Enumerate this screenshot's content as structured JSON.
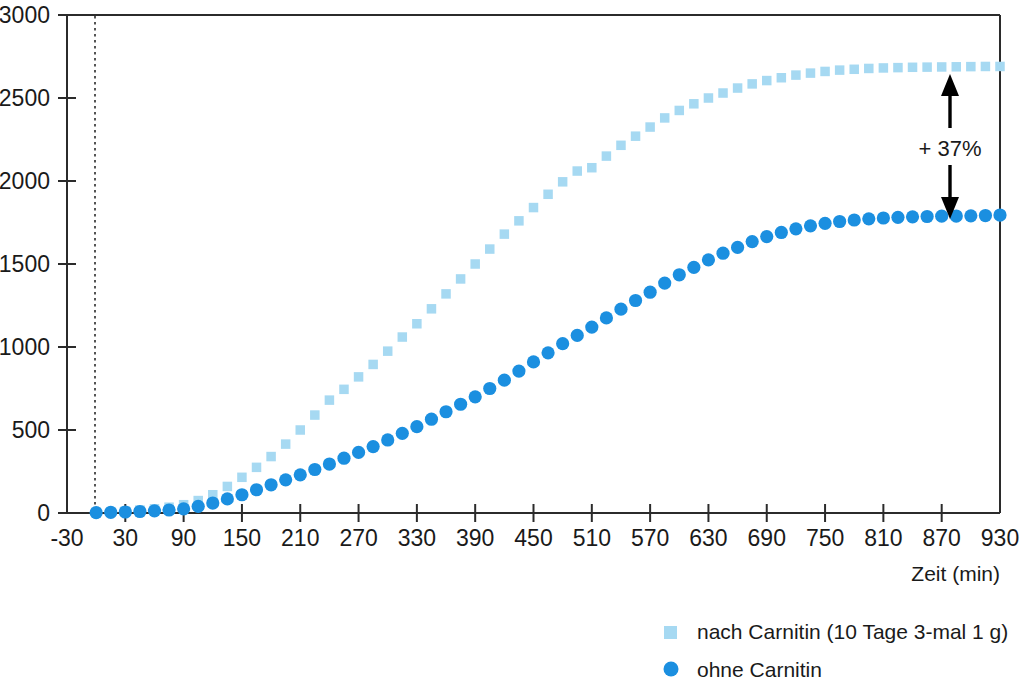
{
  "chart_data": {
    "type": "scatter",
    "title": "",
    "xlabel": "Zeit (min)",
    "ylabel": "",
    "xlim": [
      -30,
      930
    ],
    "ylim": [
      0,
      3000
    ],
    "grid": false,
    "legend_position": "bottom-right",
    "xticks": [
      -30,
      30,
      90,
      150,
      210,
      270,
      330,
      390,
      450,
      510,
      570,
      630,
      690,
      750,
      810,
      870,
      930
    ],
    "yticks": [
      0,
      500,
      1000,
      1500,
      2000,
      2500,
      3000
    ],
    "xtick_labels": [
      "-30",
      "30",
      "90",
      "150",
      "210",
      "270",
      "330",
      "390",
      "450",
      "510",
      "570",
      "630",
      "690",
      "750",
      "810",
      "870",
      "930"
    ],
    "ytick_labels": [
      "0",
      "500",
      "1000",
      "1500",
      "2000",
      "2500",
      "3000"
    ],
    "reference_line_x": 0,
    "annotations": [
      {
        "text": "+ 37%",
        "x": 870,
        "y_top": 2680,
        "y_bottom": 1780,
        "style": "double-headed-arrow"
      }
    ],
    "series": [
      {
        "name": "nach Carnitin (10 Tage 3-mal 1 g)",
        "marker": "square",
        "color": "#a6d9f2",
        "x": [
          0,
          15,
          30,
          45,
          60,
          75,
          90,
          105,
          120,
          135,
          150,
          165,
          180,
          195,
          210,
          225,
          240,
          255,
          270,
          285,
          300,
          315,
          330,
          345,
          360,
          375,
          390,
          405,
          420,
          435,
          450,
          465,
          480,
          495,
          510,
          525,
          540,
          555,
          570,
          585,
          600,
          615,
          630,
          645,
          660,
          675,
          690,
          705,
          720,
          735,
          750,
          765,
          780,
          795,
          810,
          825,
          840,
          855,
          870,
          885,
          900,
          915,
          930
        ],
        "y": [
          5,
          8,
          12,
          18,
          25,
          35,
          50,
          75,
          110,
          160,
          215,
          275,
          340,
          415,
          500,
          590,
          680,
          745,
          820,
          895,
          975,
          1060,
          1140,
          1230,
          1320,
          1410,
          1500,
          1590,
          1680,
          1760,
          1840,
          1920,
          1995,
          2060,
          2080,
          2150,
          2215,
          2270,
          2325,
          2380,
          2425,
          2465,
          2500,
          2530,
          2560,
          2585,
          2605,
          2622,
          2638,
          2650,
          2660,
          2668,
          2673,
          2678,
          2681,
          2683,
          2685,
          2686,
          2687,
          2688,
          2689,
          2690,
          2690
        ]
      },
      {
        "name": "ohne Carnitin",
        "marker": "circle",
        "color": "#1b8fe0",
        "x": [
          0,
          15,
          30,
          45,
          60,
          75,
          90,
          105,
          120,
          135,
          150,
          165,
          180,
          195,
          210,
          225,
          240,
          255,
          270,
          285,
          300,
          315,
          330,
          345,
          360,
          375,
          390,
          405,
          420,
          435,
          450,
          465,
          480,
          495,
          510,
          525,
          540,
          555,
          570,
          585,
          600,
          615,
          630,
          645,
          660,
          675,
          690,
          705,
          720,
          735,
          750,
          765,
          780,
          795,
          810,
          825,
          840,
          855,
          870,
          885,
          900,
          915,
          930
        ],
        "y": [
          2,
          4,
          6,
          9,
          13,
          18,
          25,
          40,
          60,
          85,
          110,
          140,
          170,
          200,
          230,
          262,
          295,
          330,
          365,
          400,
          440,
          480,
          520,
          565,
          610,
          655,
          700,
          750,
          800,
          855,
          910,
          965,
          1020,
          1070,
          1120,
          1175,
          1228,
          1280,
          1330,
          1385,
          1435,
          1480,
          1525,
          1565,
          1600,
          1635,
          1665,
          1690,
          1712,
          1730,
          1745,
          1756,
          1765,
          1772,
          1777,
          1781,
          1784,
          1786,
          1788,
          1789,
          1790,
          1792,
          1795
        ]
      }
    ]
  },
  "axes": {
    "x_axis_title": "Zeit (min)"
  },
  "legend": {
    "items": [
      {
        "label": "nach Carnitin (10 Tage 3-mal 1 g)",
        "marker": "square",
        "color": "#a6d9f2"
      },
      {
        "label": "ohne Carnitin",
        "marker": "circle",
        "color": "#1b8fe0"
      }
    ]
  },
  "annotation": {
    "percent_label": "+ 37%"
  },
  "colors": {
    "series_light": "#a6d9f2",
    "series_dark": "#1b8fe0",
    "axis": "#2b2b2b",
    "text": "#1a1a1a",
    "background": "#ffffff"
  }
}
